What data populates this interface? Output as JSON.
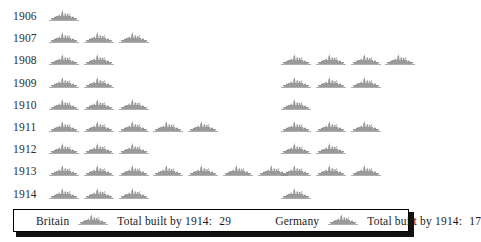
{
  "chart_data": {
    "type": "bar",
    "title": "",
    "subtitle": "",
    "xlabel": "",
    "ylabel": "",
    "note": "Pictogram chart (isotype): each ship icon represents one dreadnought battleship built in that year.",
    "icon_unit": 1,
    "icon_name": "battleship-icon",
    "categories": [
      "1906",
      "1907",
      "1908",
      "1909",
      "1910",
      "1911",
      "1912",
      "1913",
      "1914"
    ],
    "series": [
      {
        "name": "Britain",
        "color": "#9a9a9a",
        "values": [
          1,
          3,
          2,
          2,
          3,
          5,
          3,
          7,
          3
        ],
        "total": 29
      },
      {
        "name": "Germany",
        "color": "#9a9a9a",
        "values": [
          0,
          0,
          4,
          3,
          1,
          3,
          2,
          3,
          1
        ],
        "total": 17
      }
    ],
    "grid": false,
    "legend_position": "bottom"
  },
  "rows": [
    {
      "year": "1906",
      "britain": 1,
      "germany": 0
    },
    {
      "year": "1907",
      "britain": 3,
      "germany": 0
    },
    {
      "year": "1908",
      "britain": 2,
      "germany": 4
    },
    {
      "year": "1909",
      "britain": 2,
      "germany": 3
    },
    {
      "year": "1910",
      "britain": 3,
      "germany": 1
    },
    {
      "year": "1911",
      "britain": 5,
      "germany": 3
    },
    {
      "year": "1912",
      "britain": 3,
      "germany": 2
    },
    {
      "year": "1913",
      "britain": 7,
      "germany": 3
    },
    {
      "year": "1914",
      "britain": 3,
      "germany": 1
    }
  ],
  "legend": {
    "britain": {
      "name": "Britain",
      "total_label": "Total built by 1914:",
      "total_value": "29"
    },
    "germany": {
      "name": "Germany",
      "total_label": "Total built by 1914:",
      "total_value": "17"
    }
  },
  "colors": {
    "ship": "#9a9a9a",
    "ship_dark": "#8e8e8e",
    "waterline": "#8a8a8a",
    "text": "#2b2b2b",
    "legend_border": "#000000",
    "legend_shadow": "#111111",
    "background": "#ffffff"
  }
}
